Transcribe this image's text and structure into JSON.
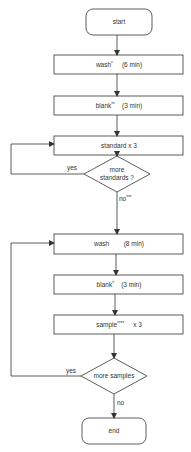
{
  "flowchart": {
    "nodes": [
      {
        "id": "start",
        "shape": "terminal",
        "label": "start"
      },
      {
        "id": "wash1",
        "shape": "process",
        "label": "wash",
        "mark": "*",
        "time": "(6 min)"
      },
      {
        "id": "blank1",
        "shape": "process",
        "label": "blank",
        "mark": "**",
        "time": "(3 min)"
      },
      {
        "id": "standard",
        "shape": "process",
        "label": "standard x 3"
      },
      {
        "id": "more_standards",
        "shape": "decision",
        "label_line1": "more",
        "label_line2": "standards ?"
      },
      {
        "id": "wash2",
        "shape": "process",
        "label": "wash",
        "time": "(8 min)"
      },
      {
        "id": "blank2",
        "shape": "process",
        "label": "blank",
        "mark": "*",
        "time": "(3 min)"
      },
      {
        "id": "sample",
        "shape": "process",
        "label": "sample",
        "mark": "****",
        "time": "x 3"
      },
      {
        "id": "more_samples",
        "shape": "decision",
        "label": "more samples"
      },
      {
        "id": "end",
        "shape": "terminal",
        "label": "end"
      }
    ],
    "edges": [
      {
        "from": "start",
        "to": "wash1"
      },
      {
        "from": "wash1",
        "to": "blank1"
      },
      {
        "from": "blank1",
        "to": "standard"
      },
      {
        "from": "standard",
        "to": "more_standards"
      },
      {
        "from": "more_standards",
        "to": "standard",
        "label": "yes"
      },
      {
        "from": "more_standards",
        "to": "wash2",
        "label": "no",
        "mark": "***"
      },
      {
        "from": "wash2",
        "to": "blank2"
      },
      {
        "from": "blank2",
        "to": "sample"
      },
      {
        "from": "sample",
        "to": "more_samples"
      },
      {
        "from": "more_samples",
        "to": "wash2",
        "label": "yes"
      },
      {
        "from": "more_samples",
        "to": "end",
        "label": "no"
      }
    ],
    "edge_labels": {
      "yes1": "yes",
      "no1": "no",
      "no1_mark": "***",
      "yes2": "yes",
      "no2": "no"
    },
    "colors": {
      "stroke": "#333333",
      "background": "#ffffff",
      "text": "#333333"
    }
  }
}
